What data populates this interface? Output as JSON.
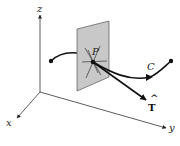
{
  "figure": {
    "labels": {
      "z_axis": "z",
      "x_axis": "x",
      "y_axis": "y",
      "point": "P",
      "curve": "C",
      "tangent": "T",
      "tangent_hat": "^"
    },
    "colors": {
      "plane_fill": "#c8c8c8",
      "plane_stroke": "#555555",
      "axis": "#333333",
      "curve": "#111111",
      "background": "#ffffff"
    }
  }
}
